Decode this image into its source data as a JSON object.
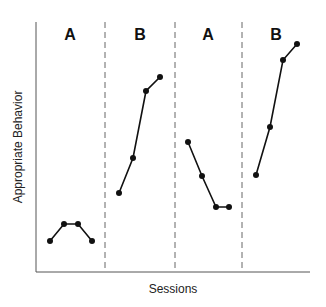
{
  "chart_data": {
    "type": "line",
    "title": "",
    "xlabel": "Sessions",
    "ylabel": "Appropriate Behavior",
    "grid": false,
    "legend": null,
    "phases": [
      "A",
      "B",
      "A",
      "B"
    ],
    "phase_change_lines": "dashed",
    "series": [
      {
        "name": "A (baseline 1)",
        "x": [
          1,
          2,
          3,
          4
        ],
        "values": [
          2,
          3,
          3,
          2
        ]
      },
      {
        "name": "B (intervention 1)",
        "x": [
          5,
          6,
          7,
          8
        ],
        "values": [
          4.8,
          7,
          11,
          12
        ]
      },
      {
        "name": "A (withdrawal)",
        "x": [
          9,
          10,
          11,
          12
        ],
        "values": [
          8,
          6,
          4,
          4
        ]
      },
      {
        "name": "B (intervention 2)",
        "x": [
          13,
          14,
          15,
          16
        ],
        "values": [
          6,
          9,
          13,
          14
        ]
      }
    ],
    "note": "Y axis has no tick labels; values are relative estimates from pixel positions"
  },
  "labels": {
    "phase1": "A",
    "phase2": "B",
    "phase3": "A",
    "phase4": "B",
    "xlabel": "Sessions",
    "ylabel": "Appropriate Behavior"
  },
  "points_px": [
    [
      [
        50,
        241
      ],
      [
        64,
        224
      ],
      [
        78,
        224
      ],
      [
        92,
        241
      ]
    ],
    [
      [
        119,
        193
      ],
      [
        133,
        158
      ],
      [
        146,
        91
      ],
      [
        160,
        77
      ]
    ],
    [
      [
        188,
        142
      ],
      [
        202,
        176
      ],
      [
        216,
        207
      ],
      [
        229,
        207
      ]
    ],
    [
      [
        256,
        175
      ],
      [
        270,
        127
      ],
      [
        283,
        60
      ],
      [
        297,
        44
      ]
    ]
  ]
}
